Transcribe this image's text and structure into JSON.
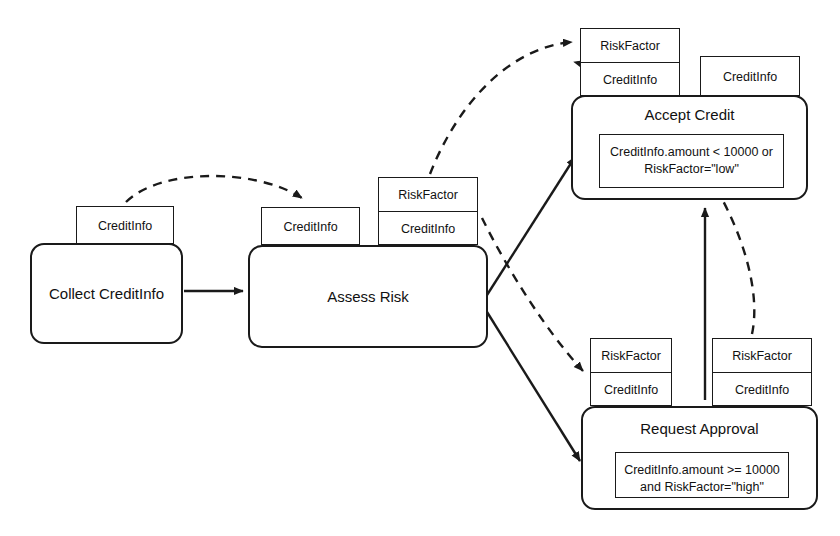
{
  "diagram": {
    "type": "uml-activity-diagram",
    "stroke_color": "#1a1a1a",
    "background_color": "#ffffff"
  },
  "nodes": [
    {
      "id": "collect-credit-info",
      "label": "Collect CreditInfo",
      "guard": "",
      "x": 30,
      "y": 243,
      "w": 153,
      "h": 101
    },
    {
      "id": "assess-risk",
      "label": "Assess Risk",
      "guard": "",
      "x": 248,
      "y": 245,
      "w": 240,
      "h": 103
    },
    {
      "id": "accept-credit",
      "label": "Accept Credit",
      "guard_line1": "CreditInfo.amount < 10000 or",
      "guard_line2": "RiskFactor=\"low\"",
      "x": 571,
      "y": 95,
      "w": 237,
      "h": 105
    },
    {
      "id": "request-approval",
      "label": "Request Approval",
      "guard_line1": "CreditInfo.amount >= 10000",
      "guard_line2": "and RiskFactor=\"high\"",
      "x": 581,
      "y": 406,
      "w": 237,
      "h": 104
    }
  ],
  "pins": [
    {
      "id": "pin-collect-output",
      "rows": [
        "CreditInfo"
      ],
      "x": 76,
      "y": 206,
      "w": 98,
      "h": 38
    },
    {
      "id": "pin-assess-input",
      "rows": [
        "CreditInfo"
      ],
      "x": 261,
      "y": 207,
      "w": 99,
      "h": 38
    },
    {
      "id": "pin-assess-output",
      "rows": [
        "RiskFactor",
        "CreditInfo"
      ],
      "x": 378,
      "y": 177,
      "w": 100,
      "h": 68
    },
    {
      "id": "pin-accept-input",
      "rows": [
        "RiskFactor",
        "CreditInfo"
      ],
      "x": 580,
      "y": 28,
      "w": 100,
      "h": 68
    },
    {
      "id": "pin-accept-extra",
      "rows": [
        "CreditInfo"
      ],
      "x": 700,
      "y": 56,
      "w": 100,
      "h": 40
    },
    {
      "id": "pin-request-input",
      "rows": [
        "RiskFactor",
        "CreditInfo"
      ],
      "x": 590,
      "y": 338,
      "w": 82,
      "h": 68
    },
    {
      "id": "pin-request-output",
      "rows": [
        "RiskFactor",
        "CreditInfo"
      ],
      "x": 712,
      "y": 338,
      "w": 100,
      "h": 68
    }
  ],
  "edges": [
    {
      "id": "edge-collect-to-assess",
      "style": "solid",
      "label": ""
    },
    {
      "id": "edge-assess-to-accept",
      "style": "solid",
      "label": ""
    },
    {
      "id": "edge-assess-to-request",
      "style": "solid",
      "label": ""
    },
    {
      "id": "edge-request-to-accept",
      "style": "solid",
      "label": ""
    },
    {
      "id": "flow-collect-pin-to-assess-pin",
      "style": "dashed",
      "label": ""
    },
    {
      "id": "flow-assess-pin-to-accept-pin",
      "style": "dashed",
      "label": ""
    },
    {
      "id": "flow-assess-pin-to-request-pin",
      "style": "dashed",
      "label": ""
    },
    {
      "id": "flow-request-pin-to-accept-pin",
      "style": "dashed",
      "label": ""
    }
  ]
}
